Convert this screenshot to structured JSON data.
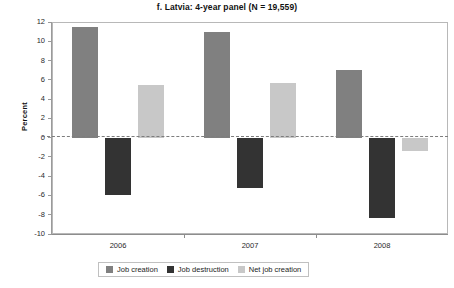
{
  "chart_data": {
    "type": "bar",
    "title": "f. Latvia: 4-year panel (N = 19,559)",
    "xlabel": "",
    "ylabel": "Percent",
    "categories": [
      "2006",
      "2007",
      "2008"
    ],
    "series": [
      {
        "name": "Job creation",
        "color": "#808080",
        "values": [
          11.5,
          11.0,
          7.0
        ]
      },
      {
        "name": "Job destruction",
        "color": "#333333",
        "values": [
          -6.0,
          -5.2,
          -8.3
        ]
      },
      {
        "name": "Net job creation",
        "color": "#c8c8c8",
        "values": [
          5.5,
          5.7,
          -1.4
        ]
      }
    ],
    "ylim": [
      -10,
      12
    ],
    "ytick_step": 2,
    "yticks": [
      "12",
      "10",
      "8",
      "6",
      "4",
      "2",
      "0",
      "-2",
      "-4",
      "-6",
      "-8",
      "-10"
    ],
    "grid": false,
    "zero_line": true,
    "zero_line_style": "dashed",
    "legend_position": "bottom-center",
    "frame": true
  },
  "legend": {
    "items": [
      {
        "label": "Job creation"
      },
      {
        "label": "Job destruction"
      },
      {
        "label": "Net job creation"
      }
    ]
  }
}
